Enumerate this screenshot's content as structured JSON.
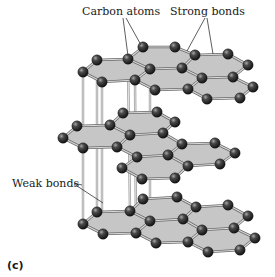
{
  "figure": {
    "panel_label": "(c)",
    "labels": {
      "carbon_atoms": "Carbon atoms",
      "strong_bonds": "Strong bonds",
      "weak_bonds": "Weak bonds"
    },
    "colors": {
      "sheet": "#c6c6c6",
      "atom": "#2a2a2a",
      "atom_highlight": "#9a9a9a",
      "bond": "#d9d9d9",
      "bond_outline": "#6a6a6a"
    }
  },
  "structure": {
    "title": "Graphite layered structure",
    "layers": [
      {
        "name": "top",
        "atoms": [
          [
            143,
            47
          ],
          [
            175,
            47
          ],
          [
            97,
            60
          ],
          [
            128,
            59
          ],
          [
            195,
            55
          ],
          [
            228,
            54
          ],
          [
            83,
            72
          ],
          [
            150,
            69
          ],
          [
            182,
            68
          ],
          [
            248,
            65
          ],
          [
            102,
            82
          ],
          [
            135,
            80
          ],
          [
            202,
            78
          ],
          [
            233,
            77
          ],
          [
            155,
            90
          ],
          [
            188,
            89
          ],
          [
            253,
            87
          ],
          [
            207,
            99
          ],
          [
            240,
            98
          ]
        ],
        "rings": [
          [
            2,
            3,
            7,
            11,
            10,
            6
          ],
          [
            3,
            0,
            1,
            4,
            8,
            7
          ],
          [
            7,
            8,
            12,
            15,
            14,
            11
          ],
          [
            4,
            5,
            9,
            13,
            12,
            8
          ],
          [
            12,
            13,
            16,
            18,
            17,
            15
          ]
        ]
      },
      {
        "name": "middle",
        "atoms": [
          [
            123,
            113
          ],
          [
            157,
            112
          ],
          [
            77,
            126
          ],
          [
            110,
            125
          ],
          [
            175,
            122
          ],
          [
            63,
            138
          ],
          [
            130,
            135
          ],
          [
            163,
            133
          ],
          [
            83,
            148
          ],
          [
            117,
            147
          ],
          [
            182,
            144
          ],
          [
            215,
            143
          ],
          [
            137,
            157
          ],
          [
            168,
            155
          ],
          [
            235,
            153
          ],
          [
            188,
            166
          ],
          [
            220,
            164
          ],
          [
            142,
            179
          ],
          [
            175,
            178
          ],
          [
            122,
            168
          ]
        ],
        "rings": [
          [
            2,
            3,
            6,
            9,
            8,
            5
          ],
          [
            3,
            0,
            1,
            4,
            7,
            6
          ],
          [
            6,
            7,
            10,
            13,
            12,
            9
          ],
          [
            10,
            11,
            14,
            16,
            15,
            13
          ],
          [
            12,
            13,
            15,
            18,
            17,
            19
          ]
        ]
      },
      {
        "name": "bottom",
        "atoms": [
          [
            143,
            199
          ],
          [
            177,
            197
          ],
          [
            97,
            212
          ],
          [
            130,
            211
          ],
          [
            196,
            207
          ],
          [
            228,
            205
          ],
          [
            83,
            224
          ],
          [
            150,
            221
          ],
          [
            183,
            219
          ],
          [
            248,
            216
          ],
          [
            103,
            234
          ],
          [
            136,
            233
          ],
          [
            202,
            230
          ],
          [
            234,
            228
          ],
          [
            156,
            243
          ],
          [
            188,
            242
          ],
          [
            255,
            238
          ],
          [
            208,
            252
          ],
          [
            240,
            250
          ]
        ],
        "rings": [
          [
            2,
            3,
            7,
            11,
            10,
            6
          ],
          [
            3,
            0,
            1,
            4,
            8,
            7
          ],
          [
            7,
            8,
            12,
            15,
            14,
            11
          ],
          [
            4,
            5,
            9,
            13,
            12,
            8
          ],
          [
            12,
            13,
            16,
            18,
            17,
            15
          ]
        ]
      }
    ],
    "weak_bonds": [
      [
        [
          83,
          72
        ],
        [
          83,
          224
        ]
      ],
      [
        [
          97,
          60
        ],
        [
          97,
          212
        ]
      ],
      [
        [
          102,
          82
        ],
        [
          102,
          234
        ]
      ],
      [
        [
          128,
          59
        ],
        [
          130,
          211
        ]
      ],
      [
        [
          135,
          80
        ],
        [
          136,
          233
        ]
      ],
      [
        [
          150,
          69
        ],
        [
          150,
          221
        ]
      ]
    ],
    "leaders": {
      "carbon_atoms": [
        [
          [
            123,
            18
          ],
          [
            128,
            56
          ]
        ],
        [
          [
            126,
            18
          ],
          [
            141,
            45
          ]
        ]
      ],
      "strong_bonds": [
        [
          [
            205,
            18
          ],
          [
            187,
            51
          ]
        ],
        [
          [
            207,
            18
          ],
          [
            213,
            54
          ]
        ]
      ],
      "weak_bonds": [
        [
          [
            74,
            183
          ],
          [
            82,
            185
          ]
        ],
        [
          [
            74,
            184
          ],
          [
            103,
            203
          ]
        ]
      ]
    }
  }
}
